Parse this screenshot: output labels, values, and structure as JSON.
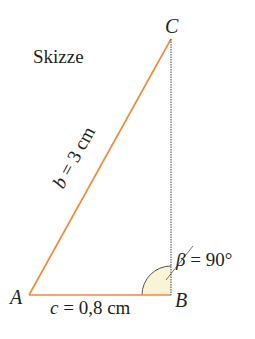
{
  "title": "Skizze",
  "vertices": {
    "A": "A",
    "B": "B",
    "C": "C"
  },
  "sides": {
    "b": {
      "var": "b",
      "text": " = 3 cm",
      "color": "#f0883c"
    },
    "c": {
      "var": "c",
      "text": " = 0,8 cm",
      "color": "#f0883c"
    },
    "a": {
      "color": "#444444",
      "style": "dashed"
    }
  },
  "angle": {
    "var": "β",
    "text": " = 90°",
    "fill": "#fbf3d6",
    "stroke": "#555555"
  },
  "geometry": {
    "A": [
      29,
      295
    ],
    "B": [
      171,
      295
    ],
    "C": [
      171,
      39
    ],
    "arc_radius": 29
  }
}
